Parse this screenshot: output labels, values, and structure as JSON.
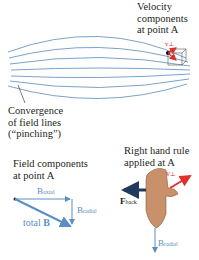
{
  "velocity_label": {
    "line1": "Velocity",
    "line2": "components",
    "line3": "at point A"
  },
  "convergence_label": {
    "line1": "Convergence",
    "line2": "of field lines",
    "line3": "(“pinching”)"
  },
  "field_components_label": {
    "line1": "Field components",
    "line2": "at point A"
  },
  "right_hand_label": {
    "line1": "Right hand rule",
    "line2": "applied at A"
  },
  "vectors": {
    "b_axial": "B",
    "b_axial_sub": "axial",
    "b_radial": "B",
    "b_radial_sub": "radial",
    "total_b_prefix": "total ",
    "total_b": "B",
    "v_perp": "v",
    "v_perp_sub": "⊥",
    "v_par": "v",
    "v_par_sub": "∥",
    "f_back": "F",
    "f_back_sub": "back",
    "b_radial_hand": "B",
    "b_radial_hand_sub": "radial"
  },
  "colors": {
    "field_line": "#7aa3cc",
    "vector_blue": "#5b8fc4",
    "velocity_red": "#e0302a",
    "force_dark": "#1f3a5c",
    "text": "#231f20",
    "skin": "#c8916a"
  }
}
